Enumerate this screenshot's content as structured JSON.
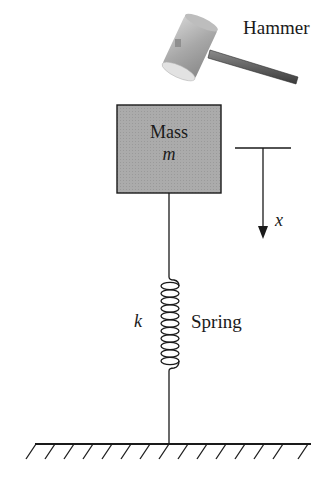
{
  "diagram": {
    "labels": {
      "hammer": "Hammer",
      "mass": "Mass",
      "mass_symbol": "m",
      "displacement_symbol": "x",
      "stiffness_symbol": "k",
      "spring": "Spring"
    },
    "components": [
      {
        "id": "hammer",
        "label": "Hammer"
      },
      {
        "id": "mass",
        "label": "Mass",
        "symbol": "m"
      },
      {
        "id": "spring",
        "label": "Spring",
        "symbol": "k"
      },
      {
        "id": "ground",
        "label": ""
      },
      {
        "id": "displacement-arrow",
        "symbol": "x",
        "direction": "down"
      }
    ],
    "colors": {
      "mass_fill": "#a9a9a9",
      "stroke": "#1a1a1a",
      "hammer_head": "#b5b5b5",
      "hammer_handle": "#6e6e6e"
    },
    "ground_hatch_count": 15,
    "spring_coil_count": 11
  }
}
